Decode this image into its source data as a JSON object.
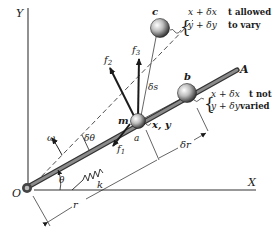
{
  "figure": {
    "axes": {
      "x_label": "X",
      "y_label": "Y",
      "origin_label": "O"
    },
    "rod_label": "A",
    "mass_label": "m",
    "position_label": "x, y",
    "points": {
      "a": "a",
      "b": "b",
      "c": "c"
    },
    "forces": {
      "f1": "f",
      "f1_sub": "1",
      "f2": "f",
      "f2_sub": "2",
      "f3": "f",
      "f3_sub": "3"
    },
    "angles": {
      "theta": "θ",
      "delta_theta": "δθ",
      "omega": "ω"
    },
    "spring_label": "k",
    "distances": {
      "r": "r",
      "delta_r": "δr",
      "delta_s": "δs"
    },
    "annotation_c": {
      "line1_expr": "x + δx",
      "line1_note": "t allowed",
      "line2_expr": "y + δy",
      "line2_note": "to vary"
    },
    "annotation_b": {
      "line1_expr": "x + δx",
      "line1_note": "t not",
      "line2_expr": "y + δy",
      "line2_note": "varied"
    }
  }
}
